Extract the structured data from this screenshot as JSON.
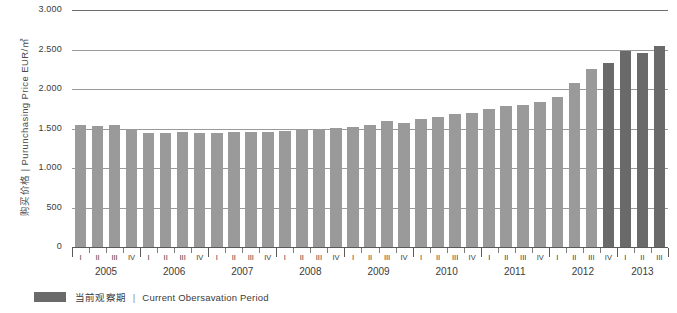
{
  "chart_data": {
    "type": "bar",
    "title": "",
    "xlabel": "",
    "ylabel": "购买价格 | Purunchasing Price  EUR/㎡",
    "ylim": [
      0,
      3000
    ],
    "yticks": [
      0,
      500,
      1000,
      1500,
      2000,
      2500,
      3000
    ],
    "ytick_labels": [
      "0",
      "500",
      "1.000",
      "1.500",
      "2.000",
      "2.500",
      "3.000"
    ],
    "grid": true,
    "legend_position": "below-left",
    "years": [
      "2005",
      "2006",
      "2007",
      "2008",
      "2009",
      "2010",
      "2011",
      "2012",
      "2013"
    ],
    "quarters": [
      "I",
      "II",
      "III",
      "IV"
    ],
    "categories": [
      "2005 I",
      "2005 II",
      "2005 III",
      "2005 IV",
      "2006 I",
      "2006 II",
      "2006 III",
      "2006 IV",
      "2007 I",
      "2007 II",
      "2007 III",
      "2007 IV",
      "2008 I",
      "2008 II",
      "2008 III",
      "2008 IV",
      "2009 I",
      "2009 II",
      "2009 III",
      "2009 IV",
      "2010 I",
      "2010 II",
      "2010 III",
      "2010 IV",
      "2011 I",
      "2011 II",
      "2011 III",
      "2011 IV",
      "2012 I",
      "2012 II",
      "2012 III",
      "2012 IV",
      "2013 I",
      "2013 II",
      "2013 III"
    ],
    "values": [
      1550,
      1530,
      1545,
      1490,
      1440,
      1440,
      1450,
      1445,
      1440,
      1450,
      1450,
      1455,
      1470,
      1500,
      1500,
      1510,
      1520,
      1545,
      1600,
      1570,
      1625,
      1650,
      1680,
      1700,
      1750,
      1790,
      1800,
      1830,
      1900,
      2080,
      2250,
      2330,
      2480,
      2460,
      2540
    ],
    "highlight_from_index": 31,
    "series_colors": {
      "normal": "#9a9a9a",
      "current": "#6a6a6a"
    }
  },
  "legend": {
    "label_cn": "当前观察期",
    "separator": "|",
    "label_en": "Current Obersavation Period"
  }
}
